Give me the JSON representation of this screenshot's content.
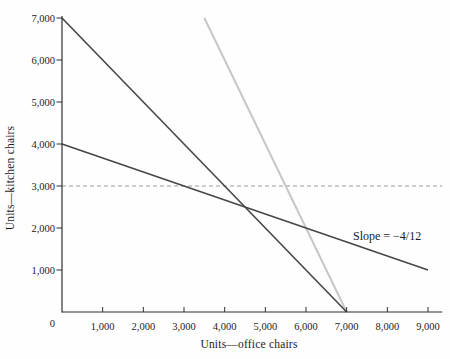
{
  "chart_data": {
    "type": "line",
    "title": "",
    "xlabel": "Units—office chairs",
    "ylabel": "Units—kitchen chairs",
    "xlim": [
      0,
      9350
    ],
    "ylim": [
      0,
      7000
    ],
    "grid": false,
    "legend": "none",
    "x_ticks": {
      "values": [
        1000,
        2000,
        3000,
        4000,
        5000,
        6000,
        7000,
        8000,
        9000
      ],
      "labels": [
        "1,000",
        "2,000",
        "3,000",
        "4,000",
        "5,000",
        "6,000",
        "7,000",
        "8,000",
        "9,000"
      ]
    },
    "y_ticks": {
      "values": [
        1000,
        2000,
        3000,
        4000,
        5000,
        6000,
        7000
      ],
      "labels": [
        "1,000",
        "2,000",
        "3,000",
        "4,000",
        "5,000",
        "6,000",
        "7,000"
      ]
    },
    "origin_label": "0",
    "series": [
      {
        "name": "dashed-horizontal-line-3000",
        "description": "dashed horizontal reference line",
        "hline": 3000,
        "color": "#9c9c9c",
        "width": 1,
        "dash": "4 3"
      },
      {
        "name": "gray-steep-line",
        "points": [
          [
            3500,
            7000
          ],
          [
            7000,
            0
          ]
        ],
        "color": "#c7c7c7",
        "width": 2,
        "dash": ""
      },
      {
        "name": "dark-steep-line",
        "points": [
          [
            0,
            7000
          ],
          [
            7000,
            0
          ]
        ],
        "color": "#464646",
        "width": 1.6,
        "dash": ""
      },
      {
        "name": "dark-shallow-line",
        "points": [
          [
            0,
            4000
          ],
          [
            9000,
            1000
          ]
        ],
        "color": "#464646",
        "width": 1.6,
        "dash": "",
        "slope": "-4/12"
      }
    ],
    "annotation": {
      "text": "Slope = −4/12"
    },
    "colors": {
      "axis": "#2f2f2f",
      "tick_text": "#1c1c1c",
      "background": "#fefefe"
    }
  }
}
